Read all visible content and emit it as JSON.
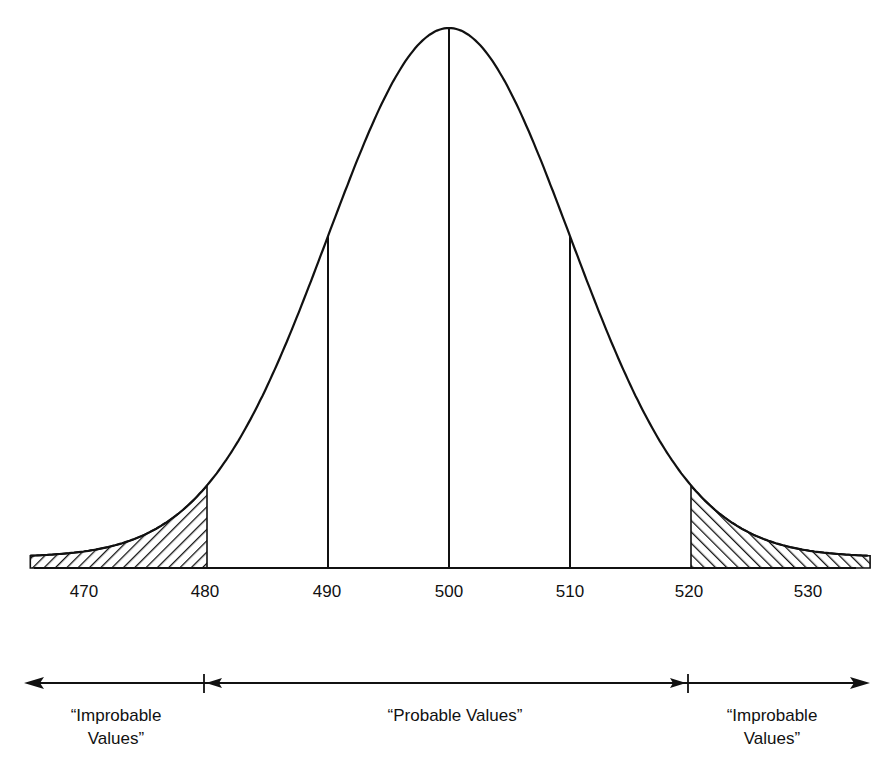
{
  "chart_data": {
    "type": "line",
    "title": "",
    "xlabel": "",
    "ylabel": "",
    "x_ticks": [
      470,
      480,
      490,
      500,
      510,
      520,
      530
    ],
    "xlim": [
      465,
      535
    ],
    "mean": 500,
    "std_dev_approx": 10,
    "vertical_lines": [
      490,
      500,
      510
    ],
    "shaded_regions": [
      {
        "from": 465,
        "to": 480,
        "label": "Improbable Values"
      },
      {
        "from": 520,
        "to": 535,
        "label": "Improbable Values"
      }
    ],
    "grid": false,
    "legend": "none"
  },
  "axis": {
    "ticks": [
      {
        "label": "470"
      },
      {
        "label": "480"
      },
      {
        "label": "490"
      },
      {
        "label": "500"
      },
      {
        "label": "510"
      },
      {
        "label": "520"
      },
      {
        "label": "530"
      }
    ]
  },
  "regions": {
    "left": {
      "line1": "“Improbable",
      "line2": "Values”"
    },
    "middle": {
      "line1": "“Probable Values”"
    },
    "right": {
      "line1": "“Improbable",
      "line2": "Values”"
    }
  },
  "colors": {
    "ink": "#111111",
    "background": "#ffffff"
  }
}
